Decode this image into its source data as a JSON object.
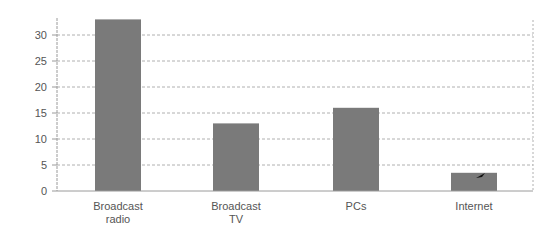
{
  "chart_data": {
    "type": "bar",
    "title": "",
    "xlabel": "",
    "ylabel": "",
    "categories": [
      "Broadcast radio",
      "Broadcast TV",
      "PCs",
      "Internet"
    ],
    "category_lines": [
      [
        "Broadcast",
        "radio"
      ],
      [
        "Broadcast",
        "TV"
      ],
      [
        "PCs"
      ],
      [
        "Internet"
      ]
    ],
    "values": [
      33,
      13,
      16,
      3.5
    ],
    "ylim": [
      0,
      33
    ],
    "yticks": [
      0,
      5,
      10,
      15,
      20,
      25,
      30
    ],
    "grid": true,
    "grid_style": "dashed horizontal",
    "legend": "none",
    "bar_color": "#7a7a7a",
    "axis_color": "#9a9a9a",
    "grid_color": "#b0b0b0"
  }
}
